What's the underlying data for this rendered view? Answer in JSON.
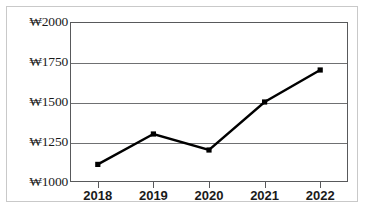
{
  "chart_data": {
    "type": "line",
    "title": "",
    "subtitle": "",
    "xlabel": "",
    "ylabel": "",
    "categories": [
      "2018",
      "2019",
      "2020",
      "2021",
      "2022"
    ],
    "series": [
      {
        "name": "",
        "values": [
          1110,
          1300,
          1200,
          1500,
          1700
        ]
      }
    ],
    "ylim": [
      1000,
      2000
    ],
    "yticks": [
      1000,
      1250,
      1500,
      1750,
      2000
    ],
    "ytick_labels": [
      "₩1000",
      "₩1250",
      "₩1500",
      "₩1750",
      "₩2000"
    ],
    "currency_symbol": "₩",
    "grid": true,
    "grid_axis": "y",
    "legend": false,
    "legend_position": "none",
    "marker": "square",
    "line_color": "#000000",
    "marker_color": "#000000",
    "grid_color": "#6f7072",
    "axis_color": "#58595b",
    "background_color": "#ffffff",
    "border_color": "#c9c9c9"
  }
}
